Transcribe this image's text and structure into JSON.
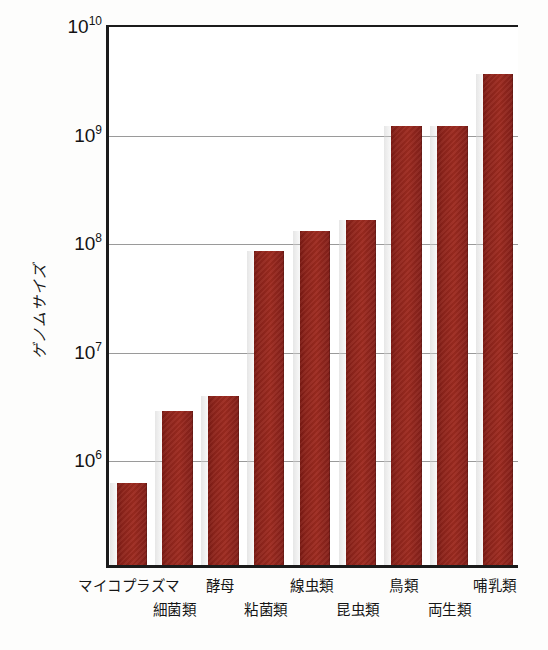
{
  "chart_data": {
    "type": "bar",
    "title": "",
    "xlabel": "",
    "ylabel": "ゲノムサイズ",
    "yscale": "log",
    "ylim": [
      100000,
      10000000000
    ],
    "grid": true,
    "legend": "none",
    "bar_color": "#8f261c",
    "categories": [
      "マイコプラズマ",
      "細菌類",
      "酵母",
      "粘菌類",
      "線虫類",
      "昆虫類",
      "鳥類",
      "両生類",
      "哺乳類"
    ],
    "values": [
      570000,
      2600000,
      3600000,
      78000000,
      120000000,
      150000000,
      1100000000,
      1100000000,
      3300000000
    ],
    "ytick_labels": [
      "10¶",
      "10⁷",
      "10⁸",
      "10⁹",
      "10¹⁰"
    ],
    "ytick_values": [
      1000000,
      10000000,
      100000000,
      1000000000,
      10000000000
    ]
  },
  "axis": {
    "y_title": "ゲノムサイズ",
    "ticks": [
      {
        "mantissa": "10",
        "exponent": "6",
        "value": 1000000
      },
      {
        "mantissa": "10",
        "exponent": "7",
        "value": 10000000
      },
      {
        "mantissa": "10",
        "exponent": "8",
        "value": 100000000
      },
      {
        "mantissa": "10",
        "exponent": "9",
        "value": 1000000000
      },
      {
        "mantissa": "10",
        "exponent": "10",
        "value": 10000000000
      }
    ]
  },
  "x_labels_top": [
    {
      "text": "マイコプラズマ",
      "index": 0
    },
    {
      "text": "酵母",
      "index": 2
    },
    {
      "text": "線虫類",
      "index": 4
    },
    {
      "text": "鳥類",
      "index": 6
    },
    {
      "text": "哺乳類",
      "index": 8
    }
  ],
  "x_labels_bottom": [
    {
      "text": "細菌類",
      "index": 1
    },
    {
      "text": "粘菌類",
      "index": 3
    },
    {
      "text": "昆虫類",
      "index": 5
    },
    {
      "text": "両生類",
      "index": 7
    }
  ]
}
